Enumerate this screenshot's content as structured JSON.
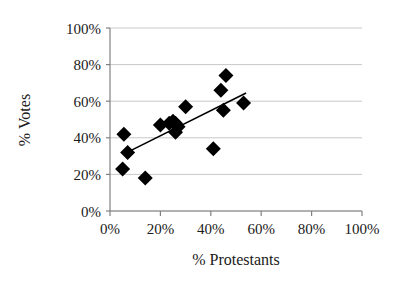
{
  "chart_data": {
    "type": "scatter",
    "title": "",
    "xlabel": "% Protestants",
    "ylabel": "% Votes",
    "xlim": [
      0,
      100
    ],
    "ylim": [
      0,
      100
    ],
    "grid": true,
    "legend": "none",
    "marker": "filled-diamond",
    "marker_color": "#000000",
    "gridline_color": "#c8c8c8",
    "axis_color": "#808080",
    "trendline_color": "#000000",
    "xticks": [
      "0%",
      "20%",
      "40%",
      "60%",
      "80%",
      "100%"
    ],
    "xtick_values": [
      0,
      20,
      40,
      60,
      80,
      100
    ],
    "yticks": [
      "0%",
      "20%",
      "40%",
      "60%",
      "80%",
      "100%"
    ],
    "ytick_values": [
      0,
      20,
      40,
      60,
      80,
      100
    ],
    "points": [
      {
        "x": 5.5,
        "y": 42
      },
      {
        "x": 7.0,
        "y": 32
      },
      {
        "x": 5.0,
        "y": 23
      },
      {
        "x": 14.0,
        "y": 18
      },
      {
        "x": 20.0,
        "y": 47
      },
      {
        "x": 23.5,
        "y": 48
      },
      {
        "x": 25.0,
        "y": 49
      },
      {
        "x": 26.0,
        "y": 48
      },
      {
        "x": 26.0,
        "y": 43
      },
      {
        "x": 27.0,
        "y": 46
      },
      {
        "x": 30.0,
        "y": 57
      },
      {
        "x": 41.0,
        "y": 34
      },
      {
        "x": 44.0,
        "y": 66
      },
      {
        "x": 45.0,
        "y": 55
      },
      {
        "x": 46.0,
        "y": 74
      },
      {
        "x": 53.0,
        "y": 59
      }
    ],
    "trendline": {
      "x_start": 6.0,
      "y_start": 31.5,
      "x_end": 54.0,
      "y_end": 64.5
    }
  }
}
